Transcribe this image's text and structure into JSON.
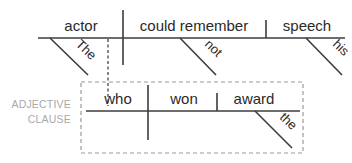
{
  "diagram": {
    "type": "Reed-Kellogg sentence diagram",
    "main_clause": {
      "subject": "actor",
      "verb": "could remember",
      "object": "speech",
      "modifiers": {
        "subject": "The",
        "verb": "not",
        "object": "his"
      }
    },
    "adjective_clause": {
      "label_line1": "ADJECTIVE",
      "label_line2": "CLAUSE",
      "subject": "who",
      "verb": "won",
      "object": "award",
      "modifiers": {
        "object": "the"
      }
    },
    "colors": {
      "line": "#3c3c3c",
      "text": "#2a2a2a",
      "label": "#a9a9a9",
      "box": "#9a9a9a"
    }
  }
}
